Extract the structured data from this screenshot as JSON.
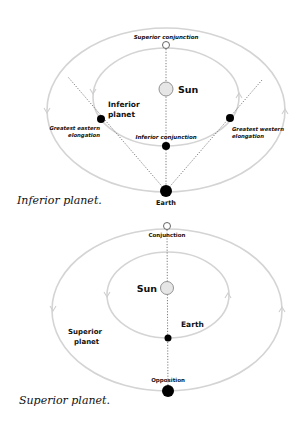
{
  "inferior_diagram": {
    "caption": "Inferior planet.",
    "labels": {
      "superior_conjunction": "Superior conjunction",
      "sun": "Sun",
      "inferior_planet_line1": "Inferior",
      "inferior_planet_line2": "planet",
      "greatest_eastern_line1": "Greatest eastern",
      "greatest_eastern_line2": "elongation",
      "greatest_western_line1": "Greatest western",
      "greatest_western_line2": "elongation",
      "inferior_conjunction": "Inferior conjunction",
      "earth": "Earth"
    }
  },
  "superior_diagram": {
    "caption": "Superior planet.",
    "labels": {
      "conjunction": "Conjunction",
      "sun": "Sun",
      "earth": "Earth",
      "superior_planet_line1": "Superior",
      "superior_planet_line2": "planet",
      "opposition": "Opposition"
    }
  },
  "colors": {
    "orbit": "#d4d4d4",
    "planet": "#000000",
    "sun_fill": "#e6e6e6",
    "text": "#111111"
  }
}
